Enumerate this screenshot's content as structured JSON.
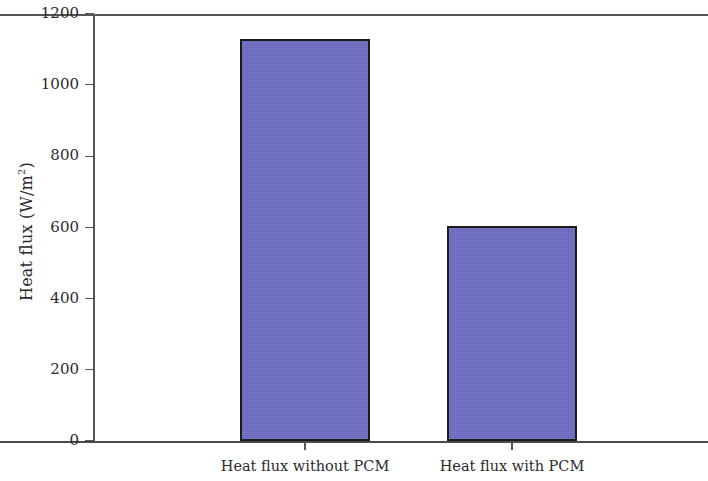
{
  "chart_data": {
    "type": "bar",
    "title": "",
    "subtitle": "",
    "xlabel": "",
    "ylabel": "Heat flux (W/m2)",
    "ylabel_base": "Heat flux (W/m",
    "ylabel_sup": "2",
    "ylabel_tail": ")",
    "categories": [
      "Heat flux without PCM",
      "Heat flux with PCM"
    ],
    "values": [
      1130,
      605
    ],
    "ylim": [
      0,
      1200
    ],
    "ytick_labels": [
      "0",
      "200",
      "400",
      "600",
      "800",
      "1000",
      "1200"
    ],
    "ytick_values": [
      0,
      200,
      400,
      600,
      800,
      1000,
      1200
    ],
    "grid": false,
    "legend": null,
    "legend_position": "none",
    "bar_fill_color": "#6e6cc4",
    "bar_edge_color": "#1b1b1b",
    "axis_color": "#555555",
    "background_color": "#ffffff",
    "annotations": []
  },
  "figure": {
    "width": 708,
    "height": 481
  }
}
